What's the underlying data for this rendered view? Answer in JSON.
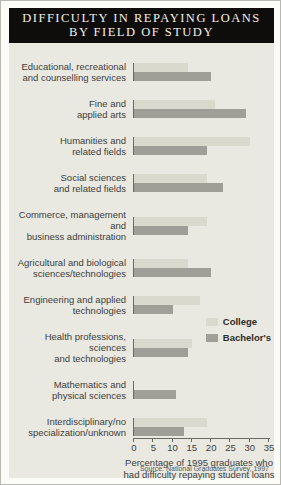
{
  "header": {
    "title_line1": "DIFFICULTY IN REPAYING LOANS",
    "title_line2": "BY FIELD OF STUDY"
  },
  "chart_data": {
    "type": "bar",
    "orientation": "horizontal",
    "categories": [
      [
        "Educational, recreational",
        "and counselling services"
      ],
      [
        "Fine and",
        "applied arts"
      ],
      [
        "Humanities and",
        "related fields"
      ],
      [
        "Social sciences",
        "and related fields"
      ],
      [
        "Commerce, management and",
        "business administration"
      ],
      [
        "Agricultural and biological",
        "sciences/technologies"
      ],
      [
        "Engineering and applied",
        "technologies"
      ],
      [
        "Health professions, sciences",
        "and technologies"
      ],
      [
        "Mathematics and",
        "physical sciences"
      ],
      [
        "Interdisciplinary/no",
        "specialization/unknown"
      ]
    ],
    "series": [
      {
        "name": "College",
        "color": "#d9d9cd",
        "values": [
          14,
          21,
          30,
          19,
          19,
          14,
          17,
          15,
          null,
          19
        ]
      },
      {
        "name": "Bachelor's",
        "color": "#9f9f97",
        "values": [
          20,
          29,
          19,
          23,
          14,
          20,
          10,
          14,
          11,
          13
        ]
      }
    ],
    "xlim": [
      0,
      35
    ],
    "xticks": [
      0,
      5,
      10,
      15,
      20,
      25,
      30,
      35
    ],
    "xlabel": "Percentage of 1995 graduates who had difficulty repaying student loans",
    "xlabel_lines": [
      "Percentage of 1995 graduates who",
      "had difficulty repaying student loans"
    ],
    "legend_position": "right-middle",
    "grid": false,
    "axis_color": "#6a6a64",
    "panel_background": "#e9e9e2"
  },
  "footer": {
    "source": "Source: National Graduates Survey, 1997"
  }
}
